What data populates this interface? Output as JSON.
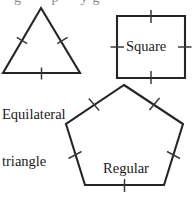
{
  "figure": {
    "title_fragment_clipped": "g   p  yg",
    "background_color": "#ffffff",
    "stroke_color": "#252525",
    "tick_color": "#3a3a3a",
    "width": 195,
    "height": 201
  },
  "shapes": [
    {
      "id": "equilateral-triangle",
      "label": "Equilateral\ntriangle",
      "label_line1": "Equilateral",
      "label_line2": "triangle",
      "sides": 3,
      "tick_marks_per_side": 1,
      "points": "41,8 80,73 3,73",
      "ticks": [
        "16.8,37.3 27.2,43.7",
        "57.2,43.7 67.6,37.3",
        "41.5,67.5 41.5,79.5"
      ]
    },
    {
      "id": "square",
      "label": "Square",
      "sides": 4,
      "tick_marks_per_side": 1,
      "points": "117,16 185,16 185,78 117,78",
      "ticks": [
        "151,10 151,23",
        "151,71 151,84",
        "110.5,47 124,47",
        "178,47 191.5,47"
      ]
    },
    {
      "id": "regular-pentagon",
      "label": "Regular\npentagon",
      "label_line1": "Regular",
      "label_line2": "pentagon",
      "sides": 5,
      "tick_marks_per_side": 1,
      "points": "124,85 183,124 164,185 85,185 66,124",
      "ticks": [
        "88.8,98.5 99.2,110.5",
        "149.5,110 159.5,98",
        "68.5,158.5 81.5,151.5",
        "167,151.5 180,158.5",
        "124.5,179 124.5,192"
      ]
    }
  ]
}
